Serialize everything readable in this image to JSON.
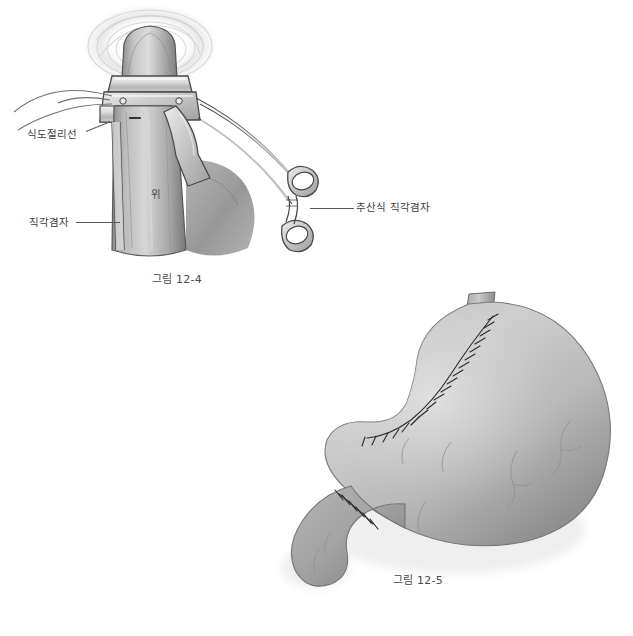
{
  "page": {
    "background_color": "#ffffff",
    "ink_color": "#3d3d3d",
    "illustration_style": "grayscale medical textbook line-and-wash illustration"
  },
  "figures": [
    {
      "id": "figure-12-4",
      "caption": "그림 12-4",
      "subject": "esophagus and proximal stomach held by a right-angle clamp with purse-string instrument",
      "annotations": [
        {
          "name": "esophagus-cut-line",
          "label": "식도절리선"
        },
        {
          "name": "right-angle-clamp",
          "label": "직각겸자"
        },
        {
          "name": "pursestring-clamp",
          "label": "추산식 직각겸자"
        },
        {
          "name": "stomach",
          "label": "위"
        }
      ]
    },
    {
      "id": "figure-12-5",
      "caption": "그림 12-5",
      "subject": "post-operative stomach with closed suture lines along lesser curvature and duodenal stump",
      "annotations": []
    }
  ],
  "colors": {
    "tissue_light": "#c9c9c9",
    "tissue_mid": "#a8a8a8",
    "tissue_dark": "#7d7d7d",
    "tissue_shadow": "#5e5e5e",
    "instrument_light": "#e2e2e2",
    "instrument_mid": "#bfbfbf",
    "instrument_outline": "#4a4a4a",
    "suture": "#2e2e2e",
    "vessel": "#8d8d8d",
    "caption_text": "#4a4a4a",
    "label_text": "#3d3d3d"
  }
}
